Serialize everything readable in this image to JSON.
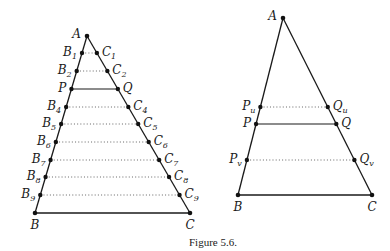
{
  "caption": "Figure 5.6.",
  "left_figure": {
    "vertices": {
      "A": {
        "label": "A",
        "x": 87,
        "y": 36
      },
      "B": {
        "label": "B",
        "x": 35,
        "y": 213
      },
      "C": {
        "label": "C",
        "x": 190,
        "y": 213
      }
    },
    "rows": [
      {
        "left": "B",
        "left_sub": "1",
        "right": "C",
        "right_sub": "1",
        "y": 53,
        "style": "dotted"
      },
      {
        "left": "B",
        "left_sub": "2",
        "right": "C",
        "right_sub": "2",
        "y": 71,
        "style": "dotted"
      },
      {
        "left": "P",
        "left_sub": "",
        "right": "Q",
        "right_sub": "",
        "y": 89,
        "style": "solid"
      },
      {
        "left": "B",
        "left_sub": "4",
        "right": "C",
        "right_sub": "4",
        "y": 107,
        "style": "dotted"
      },
      {
        "left": "B",
        "left_sub": "5",
        "right": "C",
        "right_sub": "5",
        "y": 124,
        "style": "dotted"
      },
      {
        "left": "B",
        "left_sub": "6",
        "right": "C",
        "right_sub": "6",
        "y": 142,
        "style": "dotted"
      },
      {
        "left": "B",
        "left_sub": "7",
        "right": "C",
        "right_sub": "7",
        "y": 160,
        "style": "dotted"
      },
      {
        "left": "B",
        "left_sub": "8",
        "right": "C",
        "right_sub": "8",
        "y": 177,
        "style": "dotted"
      },
      {
        "left": "B",
        "left_sub": "9",
        "right": "C",
        "right_sub": "9",
        "y": 195,
        "style": "dotted"
      }
    ]
  },
  "right_figure": {
    "vertices": {
      "A": {
        "label": "A",
        "x": 283,
        "y": 18
      },
      "B": {
        "label": "B",
        "x": 238,
        "y": 195
      },
      "C": {
        "label": "C",
        "x": 372,
        "y": 195
      }
    },
    "rows": [
      {
        "left": "P",
        "left_sub": "u",
        "right": "Q",
        "right_sub": "u",
        "y": 107,
        "style": "dotted"
      },
      {
        "left": "P",
        "left_sub": "",
        "right": "Q",
        "right_sub": "",
        "y": 124,
        "style": "solid"
      },
      {
        "left": "P",
        "left_sub": "v",
        "right": "Q",
        "right_sub": "v",
        "y": 160,
        "style": "dotted"
      }
    ]
  }
}
